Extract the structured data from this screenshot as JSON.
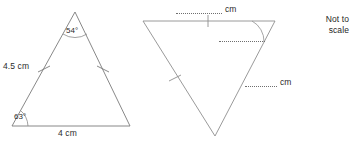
{
  "figure": {
    "caption": "Two triangles diagram with given side lengths and angles",
    "not_to_scale_note": "Not to\nscale",
    "not_to_scale_line1": "Not to",
    "not_to_scale_line2": "scale",
    "stroke_color": "#7a7a7a",
    "text_color": "#2b2b2b"
  },
  "triangle_left": {
    "name": "given-triangle",
    "apex_angle": "54°",
    "base_left_angle": "63°",
    "left_side_label": "4.5 cm",
    "base_label": "4 cm",
    "tick_count_per_equal_side": 1
  },
  "triangle_right": {
    "name": "answer-triangle",
    "top_side_unit": "cm",
    "top_side_value": "",
    "right_side_unit": "cm",
    "right_side_value": "",
    "interior_angle_value": "",
    "tick_count_per_equal_side": 1
  }
}
